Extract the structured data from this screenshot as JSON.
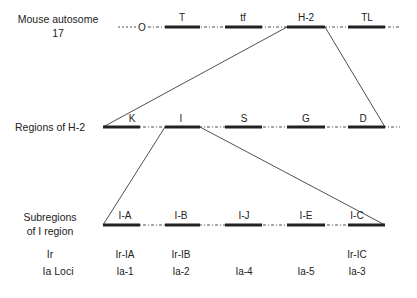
{
  "rows": {
    "chromosome": {
      "label_line1": "Mouse autosome",
      "label_line2": "17",
      "centromere": "O",
      "segments": [
        "T",
        "tf",
        "H-2",
        "TL"
      ]
    },
    "regions": {
      "label": "Regions of H-2",
      "segments": [
        "K",
        "I",
        "S",
        "G",
        "D"
      ]
    },
    "subregions": {
      "label_line1": "Subregions",
      "label_line2": "of I region",
      "segments": [
        "I-A",
        "I-B",
        "I-J",
        "I-E",
        "I-C"
      ]
    },
    "ir": {
      "label": "Ir",
      "values": [
        "Ir-IA",
        "Ir-IB",
        "",
        "",
        "Ir-IC"
      ]
    },
    "ia": {
      "label": "Ia Loci",
      "values": [
        "Ia-1",
        "Ia-2",
        "Ia-4",
        "Ia-5",
        "Ia-3"
      ]
    }
  },
  "colors": {
    "line": "#222222",
    "background": "#ffffff"
  }
}
